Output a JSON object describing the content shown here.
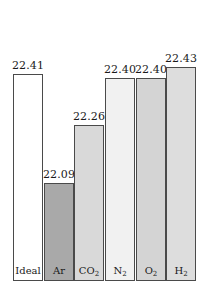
{
  "chart_data": {
    "type": "bar",
    "title": "",
    "subtitle": "",
    "xlabel": "",
    "ylabel": "",
    "grid": false,
    "legend": "none",
    "ylim": [
      0,
      22.6
    ],
    "categories": [
      "Ideal",
      "Ar",
      "CO2",
      "N2",
      "O2",
      "H2"
    ],
    "category_labels_html": [
      "Ideal",
      "Ar",
      "CO<sub>2</sub>",
      "N<sub>2</sub>",
      "O<sub>2</sub>",
      "H<sub>2</sub>"
    ],
    "values": [
      22.41,
      22.09,
      22.26,
      22.4,
      22.4,
      22.43
    ],
    "value_labels": [
      "22.41",
      "22.09",
      "22.26",
      "22.40",
      "22.40",
      "22.43"
    ],
    "bar_colors": [
      "#ffffff",
      "#a9a9a9",
      "#d9d9d9",
      "#f1f1f1",
      "#d4d4d4",
      "#dddddd"
    ],
    "bar_edge_color": "#4a4a4a"
  },
  "bars": [
    {
      "name": "Ideal",
      "label_html": "Ideal",
      "value": 22.41,
      "value_label": "22.41",
      "color": "#ffffff"
    },
    {
      "name": "Ar",
      "label_html": "Ar",
      "value": 22.09,
      "value_label": "22.09",
      "color": "#a9a9a9"
    },
    {
      "name": "CO2",
      "label_html": "CO<sub>2</sub>",
      "value": 22.26,
      "value_label": "22.26",
      "color": "#d9d9d9"
    },
    {
      "name": "N2",
      "label_html": "N<sub>2</sub>",
      "value": 22.4,
      "value_label": "22.40",
      "color": "#f1f1f1"
    },
    {
      "name": "O2",
      "label_html": "O<sub>2</sub>",
      "value": 22.4,
      "value_label": "22.40",
      "color": "#d4d4d4"
    },
    {
      "name": "H2",
      "label_html": "H<sub>2</sub>",
      "value": 22.43,
      "value_label": "22.43",
      "color": "#dddddd"
    }
  ],
  "layout": {
    "plot_left": 13,
    "plot_width": 184,
    "baseline_y": 281,
    "bar_gap": 1,
    "value_min": 21.8,
    "value_max": 22.52,
    "max_bar_height": 244,
    "value_label_offset": 14
  }
}
